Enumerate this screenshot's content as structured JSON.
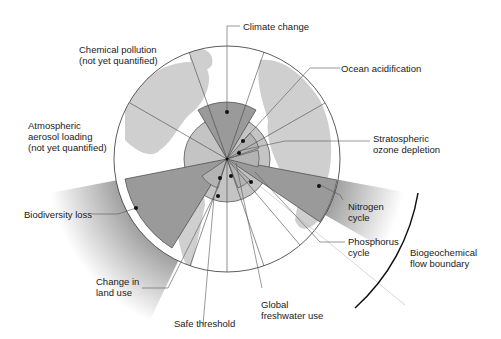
{
  "diagram": {
    "center": [
      227,
      159
    ],
    "outer_radius": 113,
    "safe_threshold_radius": 43,
    "colors": {
      "land": "#cfcfcf",
      "safe_zone": "#c4c4c4",
      "exceeded": "#9a9a9a",
      "line": "#444444",
      "label": "#1a1a1a"
    },
    "labels": {
      "climate_change": "Climate change",
      "chemical_pollution_1": "Chemical pollution",
      "chemical_pollution_2": "(not yet quantified)",
      "ocean_acidification": "Ocean acidification",
      "atmospheric_1": "Atmospheric",
      "atmospheric_2": "aerosol loading",
      "atmospheric_3": "(not yet quantified)",
      "stratospheric_1": "Stratospheric",
      "stratospheric_2": "ozone depletion",
      "biodiversity": "Biodiversity loss",
      "nitrogen_1": "Nitrogen",
      "nitrogen_2": "cycle",
      "phosphorus_1": "Phosphorus",
      "phosphorus_2": "cycle",
      "biogeochemical_1": "Biogeochemical",
      "biogeochemical_2": "flow boundary",
      "land_use_1": "Change in",
      "land_use_2": "land use",
      "freshwater_1": "Global",
      "freshwater_2": "freshwater use",
      "safe_threshold": "Safe threshold"
    }
  }
}
